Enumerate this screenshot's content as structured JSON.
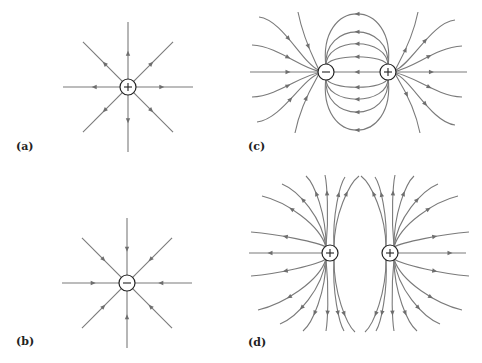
{
  "figure": {
    "line_color": "#7a7a7a",
    "charge_outline_color": "#222222",
    "panels": [
      {
        "id": "a",
        "label": "(a)",
        "label_pos": [
          16,
          140
        ],
        "type": "single",
        "charges": [
          {
            "sign": "+",
            "x": 128,
            "y": 87
          }
        ],
        "field_direction": "outward",
        "line_count": 8,
        "line_length": 65
      },
      {
        "id": "b",
        "label": "(b)",
        "label_pos": [
          16,
          335
        ],
        "type": "single",
        "charges": [
          {
            "sign": "-",
            "x": 127,
            "y": 283
          }
        ],
        "field_direction": "inward",
        "line_count": 8,
        "line_length": 65
      },
      {
        "id": "c",
        "label": "(c)",
        "label_pos": [
          248,
          140
        ],
        "type": "dipole",
        "charges": [
          {
            "sign": "-",
            "x": 326,
            "y": 72
          },
          {
            "sign": "+",
            "x": 388,
            "y": 72
          }
        ],
        "field_direction": "from + to -"
      },
      {
        "id": "d",
        "label": "(d)",
        "label_pos": [
          248,
          336
        ],
        "type": "like-charges",
        "charges": [
          {
            "sign": "+",
            "x": 330,
            "y": 253
          },
          {
            "sign": "+",
            "x": 390,
            "y": 253
          }
        ],
        "field_direction": "outward"
      }
    ]
  }
}
